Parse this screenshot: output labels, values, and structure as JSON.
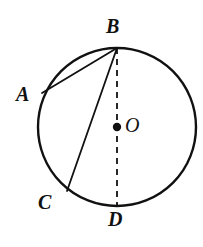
{
  "figure": {
    "kind": "circle-geometry-diagram",
    "background_color": "#ffffff",
    "stroke_color": "#111111",
    "width": 203,
    "height": 247
  },
  "circle": {
    "name": "main-circle",
    "center_x": 117,
    "center_y": 127,
    "radius": 79,
    "stroke_width": 2.4,
    "fill": "none"
  },
  "center_point": {
    "name": "center-dot",
    "x": 117,
    "y": 127,
    "radius": 4.2
  },
  "points": {
    "A": {
      "label": "A",
      "x": 42,
      "y": 93
    },
    "B": {
      "label": "B",
      "x": 117,
      "y": 48
    },
    "C": {
      "label": "C",
      "x": 67,
      "y": 191
    },
    "D": {
      "label": "D",
      "x": 117,
      "y": 206
    },
    "O": {
      "label": "O",
      "x": 117,
      "y": 127
    }
  },
  "segments": [
    {
      "name": "chord-AB",
      "from": "A",
      "to": "B",
      "style": "solid",
      "x1": 42,
      "y1": 93,
      "x2": 117,
      "y2": 48,
      "stroke_width": 1.8
    },
    {
      "name": "chord-BC",
      "from": "B",
      "to": "C",
      "style": "solid",
      "x1": 117,
      "y1": 48,
      "x2": 67,
      "y2": 191,
      "stroke_width": 1.8
    },
    {
      "name": "diameter-BD",
      "from": "B",
      "to": "D",
      "style": "dashed",
      "x1": 117,
      "y1": 48,
      "x2": 117,
      "y2": 206,
      "stroke_width": 1.8,
      "dash_pattern": "6 5"
    }
  ],
  "labels": [
    {
      "name": "point-label-A",
      "text": "A"
    },
    {
      "name": "point-label-B",
      "text": "B"
    },
    {
      "name": "point-label-C",
      "text": "C"
    },
    {
      "name": "point-label-D",
      "text": "D"
    },
    {
      "name": "point-label-O",
      "text": "O"
    }
  ]
}
